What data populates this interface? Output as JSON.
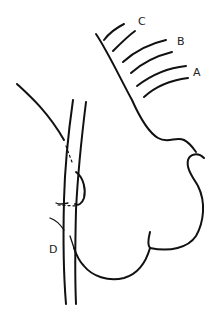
{
  "diagram": {
    "labels": {
      "a": "A",
      "b": "B",
      "c": "C",
      "d": "D"
    },
    "colors": {
      "line": "#111111",
      "text": "#222222",
      "background": "#ffffff"
    }
  }
}
